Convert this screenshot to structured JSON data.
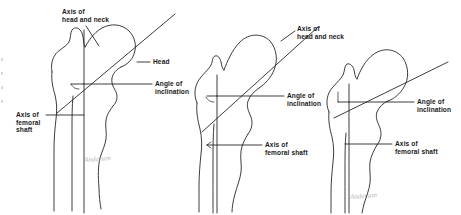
{
  "figure": {
    "background_color": "#ffffff",
    "line_color": "#1a1a1a",
    "text_color": "#1a1a1a",
    "width": 461,
    "height": 215
  },
  "panels": [
    {
      "id": "left",
      "name": "normal-femur",
      "labels": {
        "axis_head_neck": "Axis of\nhead and neck",
        "head": "Head",
        "angle_of_inclination": "Angle of\ninclination",
        "axis_femoral_shaft": "Axis of\nfemoral\nshaft"
      },
      "signature": "Anderson"
    },
    {
      "id": "middle",
      "name": "coxa-valga-femur",
      "labels": {
        "axis_head_neck": "Axis of\nhead and neck",
        "angle_of_inclination": "Angle of\ninclination",
        "axis_femoral_shaft": "Axis of\nfemoral shaft"
      },
      "signature": ""
    },
    {
      "id": "right",
      "name": "coxa-vara-femur",
      "labels": {
        "angle_of_inclination": "Angle of\ninclination",
        "axis_femoral_shaft": "Axis of\nfemoral shaft"
      },
      "signature": "Anderson"
    }
  ]
}
